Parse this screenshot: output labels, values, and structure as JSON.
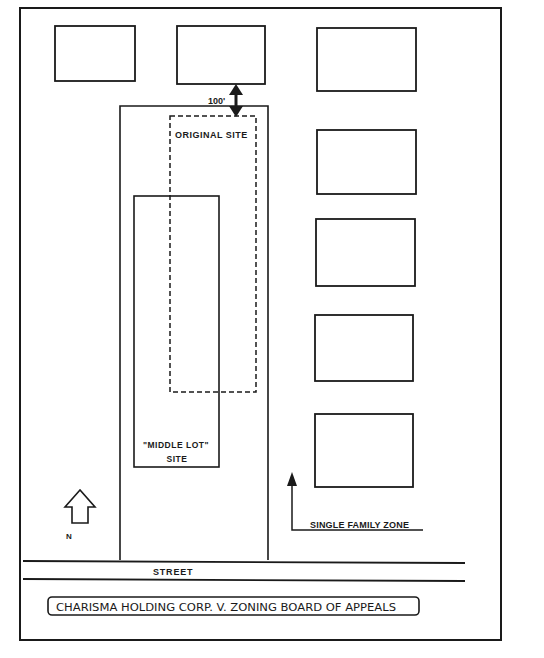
{
  "diagram": {
    "title": "CHARISMA HOLDING CORP. V. ZONING BOARD OF APPEALS",
    "labels": {
      "distance": "100'",
      "original_site": "ORIGINAL SITE",
      "middle_lot_line1": "\"MIDDLE LOT\"",
      "middle_lot_line2": "SITE",
      "zone": "SINGLE FAMILY ZONE",
      "street": "STREET",
      "north": "N"
    },
    "colors": {
      "ink": "#1a1a1a",
      "background": "#ffffff"
    },
    "elements": {
      "houses": [
        "house-top-left",
        "house-top-middle",
        "house-top-right",
        "house-right-2",
        "house-right-3",
        "house-right-4",
        "house-right-5"
      ]
    }
  }
}
